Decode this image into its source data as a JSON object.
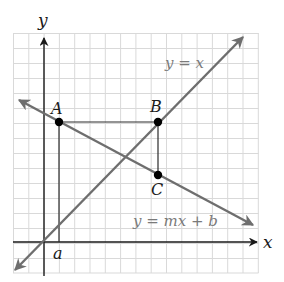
{
  "diagram": {
    "type": "coordinate-plane",
    "grid": {
      "color": "#d9d9d9",
      "background": "#ffffff"
    },
    "colors": {
      "axis": "#1a1a1a",
      "line_gray": "#6e6e6e",
      "helper": "#2a2a2a",
      "point": "#000000"
    },
    "axes": {
      "x_label": "x",
      "y_label": "y"
    },
    "lines": [
      {
        "id": "identity-line",
        "label": "y = x"
      },
      {
        "id": "linear-function-line",
        "label": "y = mx + b"
      }
    ],
    "points": [
      {
        "id": "A",
        "label": "A"
      },
      {
        "id": "B",
        "label": "B"
      },
      {
        "id": "C",
        "label": "C"
      }
    ],
    "tick_labels": [
      {
        "id": "a",
        "label": "a"
      }
    ]
  }
}
